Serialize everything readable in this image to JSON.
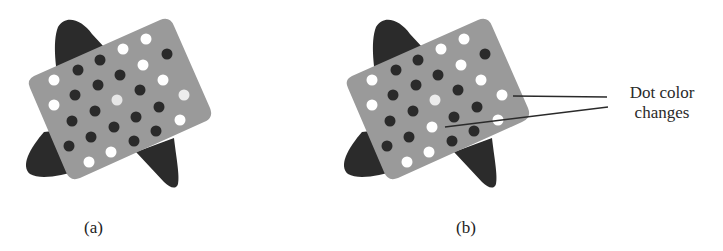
{
  "figure": {
    "panels": [
      {
        "id": "a",
        "label": "(a)"
      },
      {
        "id": "b",
        "label": "(b)"
      }
    ],
    "annotation": {
      "line1": "Dot color",
      "line2": "changes"
    },
    "colors": {
      "background": "#ffffff",
      "blob": "#2b2b2b",
      "card": "#9a9a9a",
      "dark_dot": "#2a2a2a",
      "light_dot": "#ffffff",
      "pale_dot": "#e6e6e6",
      "leader_line": "#2a2a2a"
    }
  }
}
